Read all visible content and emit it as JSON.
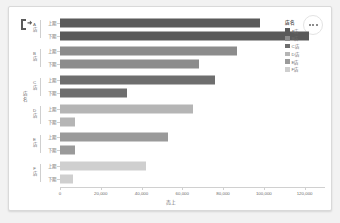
{
  "visual": {
    "focus_icon": "focus-mode-icon",
    "more_options_label": "More options",
    "more_icon": "ellipsis-icon"
  },
  "legend": {
    "title": "店名",
    "items": [
      {
        "label": "A店",
        "color": "#5a5a5a"
      },
      {
        "label": "B店",
        "color": "#8c8c8c"
      },
      {
        "label": "C店",
        "color": "#6e6e6e"
      },
      {
        "label": "D店",
        "color": "#b5b5b5"
      },
      {
        "label": "E店",
        "color": "#9a9a9a"
      },
      {
        "label": "F店",
        "color": "#cfcfcf"
      }
    ]
  },
  "chart_data": {
    "type": "bar",
    "orientation": "horizontal",
    "title": "",
    "xlabel": "売上",
    "ylabel": "店名",
    "xlim": [
      0,
      130000
    ],
    "xticks": [
      0,
      20000,
      40000,
      60000,
      80000,
      100000,
      120000
    ],
    "xticklabels": [
      "0",
      "20,000",
      "40,000",
      "60,000",
      "80,000",
      "100,000",
      "120,000"
    ],
    "grid": false,
    "legend_position": "right",
    "subcategories": [
      "上期",
      "下期"
    ],
    "categories": [
      "A店",
      "B店",
      "C店",
      "D店",
      "E店",
      "F店"
    ],
    "groups": [
      {
        "category": "A店",
        "color": "#5a5a5a",
        "bars": [
          {
            "label": "上期",
            "value": 98000
          },
          {
            "label": "下期",
            "value": 122000
          }
        ]
      },
      {
        "category": "B店",
        "color": "#8c8c8c",
        "bars": [
          {
            "label": "上期",
            "value": 87000
          },
          {
            "label": "下期",
            "value": 68000
          }
        ]
      },
      {
        "category": "C店",
        "color": "#6e6e6e",
        "bars": [
          {
            "label": "上期",
            "value": 76000
          },
          {
            "label": "下期",
            "value": 33000
          }
        ]
      },
      {
        "category": "D店",
        "color": "#b5b5b5",
        "bars": [
          {
            "label": "上期",
            "value": 65000
          },
          {
            "label": "下期",
            "value": 7500
          }
        ]
      },
      {
        "category": "E店",
        "color": "#9a9a9a",
        "bars": [
          {
            "label": "上期",
            "value": 53000
          },
          {
            "label": "下期",
            "value": 7500
          }
        ]
      },
      {
        "category": "F店",
        "color": "#cfcfcf",
        "bars": [
          {
            "label": "上期",
            "value": 42000
          },
          {
            "label": "下期",
            "value": 6500
          }
        ]
      }
    ]
  }
}
